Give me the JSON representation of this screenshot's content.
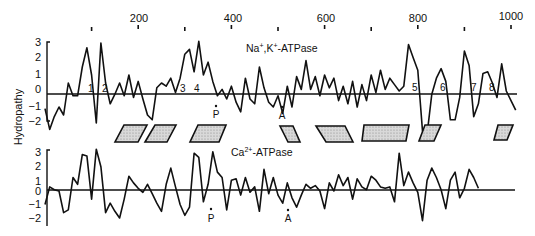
{
  "chart_data": [
    {
      "type": "line",
      "title": "Na⁺,K⁺-ATPase",
      "ylabel": "Hydropathy",
      "xlabel": "",
      "x_tick_labels": [
        "200",
        "400",
        "600",
        "800",
        "1000"
      ],
      "x_ticks": [
        100,
        200,
        300,
        400,
        500,
        600,
        700,
        800,
        900,
        1000
      ],
      "y_ticks": [
        "3",
        "2",
        "1",
        "0",
        "−1",
        "−2"
      ],
      "ylim": [
        -2.5,
        3.2
      ],
      "xlim": [
        0,
        1020
      ],
      "grid": false,
      "legend": "none",
      "x": [
        0,
        10,
        20,
        30,
        40,
        50,
        60,
        70,
        80,
        90,
        100,
        110,
        120,
        130,
        140,
        150,
        160,
        170,
        180,
        190,
        200,
        210,
        220,
        230,
        240,
        250,
        260,
        270,
        280,
        290,
        300,
        310,
        320,
        330,
        340,
        350,
        360,
        370,
        380,
        390,
        400,
        410,
        420,
        430,
        440,
        450,
        460,
        470,
        480,
        490,
        500,
        510,
        520,
        530,
        540,
        550,
        560,
        570,
        580,
        590,
        600,
        610,
        620,
        630,
        640,
        650,
        660,
        670,
        680,
        690,
        700,
        710,
        720,
        730,
        740,
        750,
        760,
        770,
        780,
        790,
        800,
        810,
        820,
        830,
        840,
        850,
        860,
        870,
        880,
        890,
        900,
        910,
        920,
        930,
        940,
        950,
        960,
        970,
        980,
        990,
        1000,
        1010
      ],
      "values": [
        -1.1,
        -2.4,
        -1.6,
        -1.0,
        -1.5,
        0.5,
        -0.3,
        -0.3,
        1.5,
        2.7,
        1.0,
        -2.0,
        3.0,
        0.5,
        -0.8,
        -0.2,
        0.5,
        -0.3,
        1.0,
        -0.4,
        0.6,
        -0.5,
        -1.5,
        -1.8,
        0.2,
        0.5,
        0.3,
        0.8,
        -0.1,
        0.8,
        2.3,
        2.6,
        1.2,
        3.1,
        1.0,
        1.8,
        0.6,
        -0.3,
        0.1,
        -0.5,
        0.3,
        -0.7,
        -1.3,
        0.8,
        -0.5,
        -0.8,
        1.5,
        0.2,
        -0.7,
        -1.0,
        -0.3,
        -1.4,
        0.3,
        -1.0,
        0.9,
        0.1,
        1.9,
        0.1,
        0.9,
        -0.3,
        1.0,
        0.2,
        0.8,
        -0.6,
        0.3,
        -0.8,
        0.6,
        -1.0,
        0.4,
        -0.6,
        1.0,
        -0.1,
        1.3,
        0.1,
        0.8,
        0.4,
        0.0,
        0.3,
        2.9,
        2.1,
        1.3,
        -2.5,
        -2.7,
        -0.2,
        0.8,
        1.4,
        0.6,
        -1.8,
        -1.8,
        -0.4,
        2.5,
        1.6,
        -1.6,
        -0.8,
        1.1,
        1.2,
        0.5,
        -0.4,
        1.7,
        0.0,
        -0.6,
        -1.2
      ],
      "annotations": {
        "transmembrane_segments": [
          "1",
          "2",
          "3",
          "4",
          "5",
          "6",
          "7",
          "8"
        ],
        "sites": [
          {
            "label": "P",
            "x": 365
          },
          {
            "label": "A",
            "x": 510
          }
        ]
      }
    },
    {
      "type": "line",
      "title": "Ca²⁺-ATPase",
      "ylabel": "Hydropathy",
      "xlabel": "",
      "y_ticks": [
        "3",
        "2",
        "1",
        "0",
        "−1",
        "−2"
      ],
      "ylim": [
        -2.5,
        3.2
      ],
      "xlim": [
        0,
        1020
      ],
      "grid": false,
      "legend": "none",
      "x": [
        0,
        10,
        20,
        30,
        40,
        50,
        60,
        70,
        80,
        90,
        100,
        110,
        120,
        130,
        140,
        150,
        160,
        170,
        180,
        190,
        200,
        210,
        220,
        230,
        240,
        250,
        260,
        270,
        280,
        290,
        300,
        310,
        320,
        330,
        340,
        350,
        360,
        370,
        380,
        390,
        400,
        410,
        420,
        430,
        440,
        450,
        460,
        470,
        480,
        490,
        500,
        510,
        520,
        530,
        540,
        550,
        560,
        570,
        580,
        590,
        600,
        610,
        620,
        630,
        640,
        650,
        660,
        670,
        680,
        690,
        700,
        710,
        720,
        730,
        740,
        750,
        760,
        770,
        780,
        790,
        800,
        810,
        820,
        830,
        840,
        850,
        860,
        870,
        880,
        890,
        900,
        910,
        920,
        930
      ],
      "values": [
        -1.0,
        0.3,
        0.1,
        0.0,
        -1.6,
        -1.4,
        1.0,
        0.5,
        2.7,
        2.6,
        -0.6,
        3.1,
        1.8,
        -1.6,
        -0.9,
        -1.5,
        -2.0,
        -0.6,
        1.1,
        0.6,
        0.2,
        -0.1,
        0.5,
        -0.2,
        -0.9,
        -1.5,
        0.5,
        1.7,
        0.3,
        -1.0,
        -1.8,
        -1.2,
        2.8,
        2.5,
        -0.8,
        0.5,
        2.9,
        1.4,
        1.0,
        -1.4,
        0.8,
        0.9,
        -0.3,
        1.0,
        -0.1,
        0.3,
        -1.5,
        1.6,
        -0.2,
        1.0,
        -0.3,
        -0.9,
        0.6,
        -0.5,
        -1.2,
        -0.3,
        0.5,
        0.2,
        0.4,
        0.0,
        -1.3,
        0.6,
        0.0,
        1.2,
        0.4,
        1.0,
        -0.6,
        0.9,
        0.3,
        0.1,
        1.1,
        0.8,
        0.3,
        0.2,
        0.3,
        -0.8,
        2.8,
        0.4,
        1.4,
        0.6,
        -0.1,
        -2.2,
        0.8,
        1.7,
        1.0,
        0.1,
        -1.3,
        0.8,
        1.4,
        -0.5,
        0.2,
        1.6,
        1.0,
        0.2
      ],
      "annotations": {
        "sites": [
          {
            "label": "P",
            "x": 355
          },
          {
            "label": "A",
            "x": 510
          }
        ]
      }
    }
  ],
  "figure": {
    "y_axis_label": "Hydropathy",
    "top_axis_labels": [
      {
        "value": 200,
        "text": "200"
      },
      {
        "value": 400,
        "text": "400"
      },
      {
        "value": 600,
        "text": "600"
      },
      {
        "value": 800,
        "text": "800"
      },
      {
        "value": 1000,
        "text": "1000"
      }
    ],
    "upper": {
      "title_main": "Na",
      "title_sup1": "+",
      "title_mid": ",K",
      "title_sup2": "+",
      "title_end": "-ATPase",
      "y_ticks": [
        "3",
        "2",
        "1",
        "0",
        "−1",
        "−2"
      ],
      "segment_labels": [
        "1",
        "2",
        "3",
        "4",
        "5",
        "6",
        "7",
        "8"
      ],
      "site_p": "P",
      "site_a": "A"
    },
    "lower": {
      "title_main": "Ca",
      "title_sup": "2+",
      "title_end": "-ATPase",
      "y_ticks": [
        "3",
        "2",
        "1",
        "0",
        "−1",
        "−2"
      ],
      "site_p": "P",
      "site_a": "A"
    },
    "alignment_blocks_count": 8
  }
}
